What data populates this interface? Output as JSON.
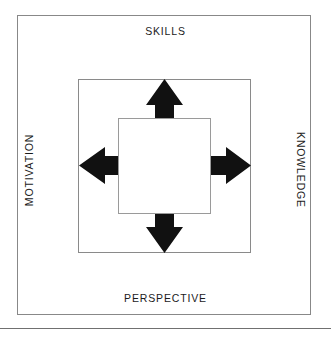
{
  "diagram": {
    "labels": {
      "top": "SKILLS",
      "right": "KNOWLEDGE",
      "bottom": "PERSPECTIVE",
      "left": "MOTIVATION"
    },
    "colors": {
      "background": "#ffffff",
      "arrow_fill": "#111111",
      "frame_stroke": "#888888",
      "text": "#1b1b1b",
      "rule": "#707070"
    },
    "arrows": [
      {
        "name": "arrow-up",
        "direction": "up",
        "points_to": "SKILLS"
      },
      {
        "name": "arrow-right",
        "direction": "right",
        "points_to": "KNOWLEDGE"
      },
      {
        "name": "arrow-down",
        "direction": "down",
        "points_to": "PERSPECTIVE"
      },
      {
        "name": "arrow-left",
        "direction": "left",
        "points_to": "MOTIVATION"
      }
    ],
    "frames": [
      {
        "name": "outer-frame"
      },
      {
        "name": "middle-frame"
      },
      {
        "name": "inner-square"
      }
    ]
  }
}
